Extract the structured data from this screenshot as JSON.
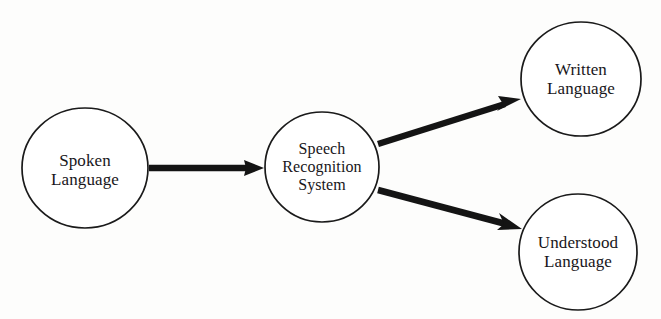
{
  "diagram": {
    "background_color": "#fdfdfc",
    "stroke_color": "#1a1a1a",
    "nodes": [
      {
        "id": "spoken-language",
        "label": "Spoken\nLanguage",
        "shape": "ellipse",
        "cx": 85,
        "cy": 168,
        "rx": 63,
        "ry": 60
      },
      {
        "id": "speech-recognition-system",
        "label": "Speech\nRecognition\nSystem",
        "shape": "ellipse",
        "cx": 322,
        "cy": 167,
        "rx": 57,
        "ry": 55
      },
      {
        "id": "written-language",
        "label": "Written\nLanguage",
        "shape": "ellipse",
        "cx": 581,
        "cy": 79,
        "rx": 60,
        "ry": 57
      },
      {
        "id": "understood-language",
        "label": "Understood\nLanguage",
        "shape": "ellipse",
        "cx": 578,
        "cy": 252,
        "rx": 59,
        "ry": 58
      }
    ],
    "edges": [
      {
        "id": "spoken-to-system",
        "from": "spoken-language",
        "to": "speech-recognition-system",
        "x1": 149,
        "y1": 168,
        "x2": 264,
        "y2": 168,
        "arrowhead": "filled-triangle"
      },
      {
        "id": "system-to-written",
        "from": "speech-recognition-system",
        "to": "written-language",
        "x1": 378,
        "y1": 144,
        "x2": 521,
        "y2": 99,
        "arrowhead": "filled-triangle"
      },
      {
        "id": "system-to-understood",
        "from": "speech-recognition-system",
        "to": "understood-language",
        "x1": 378,
        "y1": 190,
        "x2": 522,
        "y2": 229,
        "arrowhead": "filled-triangle"
      }
    ]
  }
}
